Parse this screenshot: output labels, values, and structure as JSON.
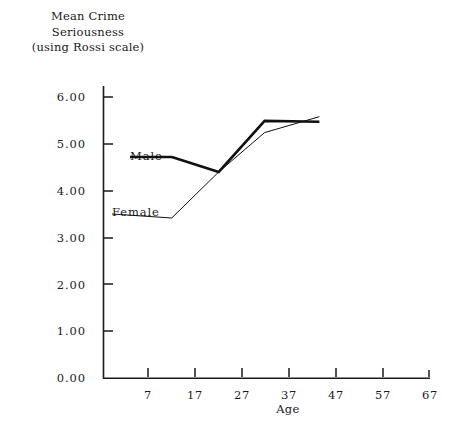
{
  "chart_data": {
    "type": "line",
    "title": "Mean Crime Seriousness (using Rossi scale)",
    "title_lines": [
      "Mean Crime",
      "Seriousness",
      "(using Rossi scale)"
    ],
    "xlabel": "Age",
    "ylabel": "Mean Crime Seriousness (using Rossi scale)",
    "xlim": [
      2,
      67
    ],
    "ylim": [
      0.0,
      6.3
    ],
    "xticks": [
      7,
      17,
      27,
      37,
      47,
      57,
      67
    ],
    "xtick_labels": [
      "7",
      "17",
      "27",
      "37",
      "47",
      "57",
      "67"
    ],
    "yticks": [
      0.0,
      1.0,
      2.0,
      3.0,
      4.0,
      5.0,
      6.0
    ],
    "ytick_labels": [
      "0.00",
      "1.00",
      "2.00",
      "3.00",
      "4.00",
      "5.00",
      "6.00"
    ],
    "grid": false,
    "legend_position": "inline-annotations",
    "line_color": "#111111",
    "axis_color": "#1a1a1a",
    "series": [
      {
        "name": "Male",
        "label": "Male",
        "style": "thick",
        "linewidth": 2.6,
        "x": [
          12.1,
          22.1,
          31.9,
          43.6
        ],
        "y": [
          4.72,
          4.4,
          5.49,
          5.47
        ]
      },
      {
        "name": "Female",
        "label": "Female",
        "style": "thin",
        "linewidth": 1.0,
        "x": [
          12.1,
          22.1,
          31.9,
          43.6
        ],
        "y": [
          3.42,
          4.4,
          5.24,
          5.58
        ]
      }
    ],
    "annotations": [
      {
        "text": "Male",
        "leader_from": [
          130,
          157
        ],
        "leader_to": [
          172,
          157
        ],
        "target_series": "Male"
      },
      {
        "text": "Female",
        "leader_from": [
          112,
          214
        ],
        "leader_to": [
          172,
          218
        ],
        "target_series": "Female"
      }
    ]
  }
}
